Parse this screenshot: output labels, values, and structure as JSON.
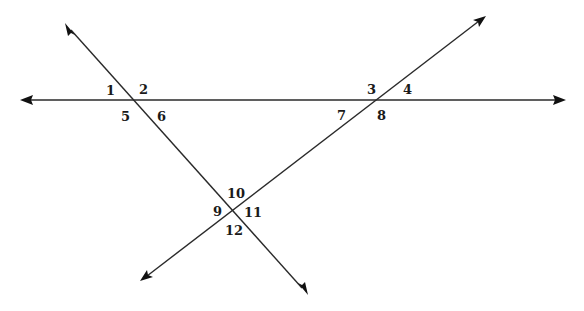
{
  "diagram": {
    "colors": {
      "line": "#2a2a2a",
      "arrow": "#111111",
      "label": "#1a1a1a",
      "background": "#ffffff"
    },
    "lines": [
      {
        "id": "horizontal",
        "from": [
          20,
          100
        ],
        "to": [
          566,
          100
        ]
      },
      {
        "id": "transversal-down-right",
        "from": [
          65,
          23
        ],
        "to": [
          308,
          295
        ]
      },
      {
        "id": "transversal-up-right",
        "from": [
          140,
          281
        ],
        "to": [
          486,
          16
        ]
      }
    ],
    "intersections": [
      {
        "id": "P1",
        "point": [
          133,
          100
        ],
        "angles": [
          "1",
          "2",
          "5",
          "6"
        ]
      },
      {
        "id": "P2",
        "point": [
          378,
          100
        ],
        "angles": [
          "3",
          "4",
          "7",
          "8"
        ]
      },
      {
        "id": "P3",
        "point": [
          233,
          210
        ],
        "angles": [
          "9",
          "10",
          "11",
          "12"
        ]
      }
    ],
    "angle_labels": {
      "a1": "1",
      "a2": "2",
      "a3": "3",
      "a4": "4",
      "a5": "5",
      "a6": "6",
      "a7": "7",
      "a8": "8",
      "a9": "9",
      "a10": "10",
      "a11": "11",
      "a12": "12"
    }
  }
}
